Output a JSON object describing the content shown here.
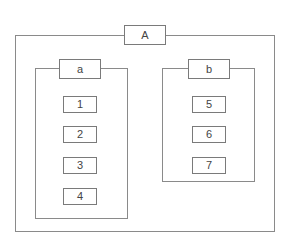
{
  "diagram": {
    "type": "nested-containment",
    "colors": {
      "line": "#8a8a8a",
      "text": "#444444",
      "background": "#ffffff"
    },
    "outer": {
      "label": "A",
      "groups": [
        {
          "label": "a",
          "items": [
            "1",
            "2",
            "3",
            "4"
          ]
        },
        {
          "label": "b",
          "items": [
            "5",
            "6",
            "7"
          ]
        }
      ]
    }
  }
}
